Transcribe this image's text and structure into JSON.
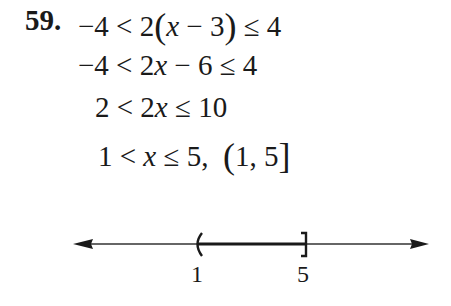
{
  "problem": {
    "number": "59.",
    "steps": [
      {
        "parts": [
          "−4 < 2",
          "(",
          "x",
          " − 3",
          ")",
          " ≤ 4"
        ]
      },
      {
        "parts": [
          "−4 < 2",
          "x",
          " − 6 ≤ 4"
        ]
      },
      {
        "parts": [
          "2 < 2",
          "x",
          " ≤ 10"
        ]
      },
      {
        "parts": [
          "1 < ",
          "x",
          " ≤ 5,  ",
          "(",
          "1, 5",
          "]"
        ]
      }
    ]
  },
  "number_line": {
    "interval": "(1, 5]",
    "left_endpoint": {
      "value": "1",
      "type": "open",
      "symbol": "("
    },
    "right_endpoint": {
      "value": "5",
      "type": "closed",
      "symbol": "]"
    },
    "tick_labels": [
      "1",
      "5"
    ],
    "colors": {
      "line": "#1a1a1a"
    }
  }
}
